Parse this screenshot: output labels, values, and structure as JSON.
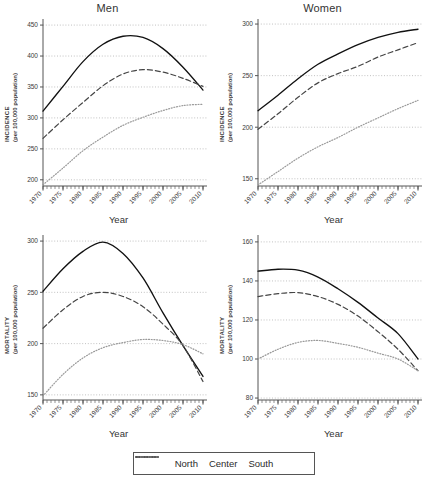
{
  "figure": {
    "legend": {
      "items": [
        {
          "name": "North",
          "style": "solid"
        },
        {
          "name": "Center",
          "style": "dashed"
        },
        {
          "name": "South",
          "style": "dotted"
        }
      ]
    }
  },
  "chart_data": [
    {
      "type": "line",
      "title": "Men",
      "xlabel": "Year",
      "ylabel": "INCIDENCE",
      "ylabel_sub": "(per 100,000 population)",
      "grid": true,
      "legend_position": "bottom",
      "xlim": [
        1970,
        2011
      ],
      "ylim": [
        190,
        455
      ],
      "yticks": [
        200,
        250,
        300,
        350,
        400,
        450
      ],
      "xticks": [
        1970,
        1975,
        1980,
        1985,
        1990,
        1995,
        2000,
        2005,
        2010
      ],
      "x": [
        1970,
        1975,
        1980,
        1985,
        1990,
        1995,
        2000,
        2005,
        2010
      ],
      "series": [
        {
          "name": "North",
          "style": "solid",
          "values": [
            311,
            351,
            391,
            419,
            432,
            430,
            412,
            382,
            345
          ]
        },
        {
          "name": "Center",
          "style": "dashed",
          "values": [
            267,
            297,
            325,
            352,
            371,
            378,
            374,
            364,
            351
          ]
        },
        {
          "name": "South",
          "style": "dotted",
          "values": [
            192,
            219,
            247,
            269,
            288,
            301,
            312,
            320,
            322
          ]
        }
      ]
    },
    {
      "type": "line",
      "title": "Women",
      "xlabel": "Year",
      "ylabel": "INCIDENCE",
      "ylabel_sub": "(per 100,000 population)",
      "grid": true,
      "legend_position": "bottom",
      "xlim": [
        1970,
        2011
      ],
      "ylim": [
        143,
        302
      ],
      "yticks": [
        150,
        200,
        250,
        300
      ],
      "xticks": [
        1970,
        1975,
        1980,
        1985,
        1990,
        1995,
        2000,
        2005,
        2010
      ],
      "x": [
        1970,
        1975,
        1980,
        1985,
        1990,
        1995,
        2000,
        2005,
        2010
      ],
      "series": [
        {
          "name": "North",
          "style": "solid",
          "values": [
            216,
            231,
            247,
            261,
            271,
            280,
            287,
            292,
            295
          ]
        },
        {
          "name": "Center",
          "style": "dashed",
          "values": [
            198,
            213,
            229,
            243,
            252,
            259,
            268,
            275,
            282
          ]
        },
        {
          "name": "South",
          "style": "dotted",
          "values": [
            144,
            157,
            170,
            181,
            190,
            200,
            209,
            218,
            226
          ]
        }
      ]
    },
    {
      "type": "line",
      "title": "",
      "xlabel": "Year",
      "ylabel": "MORTALITY",
      "ylabel_sub": "(per 100,000 population)",
      "grid": true,
      "legend_position": "bottom",
      "xlim": [
        1970,
        2011
      ],
      "ylim": [
        145,
        303
      ],
      "yticks": [
        150,
        200,
        250,
        300
      ],
      "xticks": [
        1970,
        1975,
        1980,
        1985,
        1990,
        1995,
        2000,
        2005,
        2010
      ],
      "x": [
        1970,
        1975,
        1980,
        1985,
        1990,
        1995,
        2000,
        2005,
        2010
      ],
      "series": [
        {
          "name": "North",
          "style": "solid",
          "values": [
            251,
            273,
            290,
            299,
            288,
            264,
            230,
            198,
            168
          ]
        },
        {
          "name": "Center",
          "style": "dashed",
          "values": [
            215,
            233,
            246,
            250,
            246,
            236,
            219,
            198,
            163
          ]
        },
        {
          "name": "South",
          "style": "dotted",
          "values": [
            149,
            170,
            186,
            196,
            201,
            204,
            203,
            199,
            190
          ]
        }
      ]
    },
    {
      "type": "line",
      "title": "",
      "xlabel": "Year",
      "ylabel": "MORTALITY",
      "ylabel_sub": "(per 100,000 population)",
      "grid": true,
      "legend_position": "bottom",
      "xlim": [
        1970,
        2011
      ],
      "ylim": [
        79,
        162
      ],
      "yticks": [
        80,
        100,
        120,
        140,
        160
      ],
      "xticks": [
        1970,
        1975,
        1980,
        1985,
        1990,
        1995,
        2000,
        2005,
        2010
      ],
      "x": [
        1970,
        1975,
        1980,
        1985,
        1990,
        1995,
        2000,
        2005,
        2010
      ],
      "series": [
        {
          "name": "North",
          "style": "solid",
          "values": [
            145,
            146,
            145.5,
            142,
            136,
            129,
            121,
            113,
            100
          ]
        },
        {
          "name": "Center",
          "style": "dashed",
          "values": [
            132,
            133.5,
            134,
            132,
            128,
            122,
            114,
            105,
            94
          ]
        },
        {
          "name": "South",
          "style": "dotted",
          "values": [
            100,
            105,
            108.5,
            109.5,
            108,
            106,
            103,
            100,
            94
          ]
        }
      ]
    }
  ]
}
